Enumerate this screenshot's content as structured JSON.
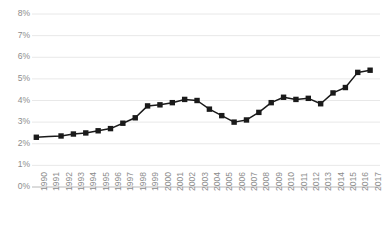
{
  "chart_data": {
    "type": "line",
    "title": "",
    "subtitle": "",
    "xlabel": "",
    "ylabel": "",
    "ylim": [
      0,
      8
    ],
    "ytick_values": [
      0,
      1,
      2,
      3,
      4,
      5,
      6,
      7,
      8
    ],
    "ytick_labels": [
      "0%",
      "1%",
      "2%",
      "3%",
      "4%",
      "5%",
      "6%",
      "7%",
      "8%"
    ],
    "y_unit": "%",
    "grid": true,
    "grid_axis": "y",
    "grid_color": "#e2e2e2",
    "legend": false,
    "legend_entries": [],
    "annotations": [],
    "line_color": "#1a1a1a",
    "marker": "square",
    "marker_color": "#1a1a1a",
    "background_color": "#ffffff",
    "axis_label_color": "#8c8c8c",
    "x_tick_rotation": -90,
    "categories": [
      "1990",
      "1991",
      "1992",
      "1993",
      "1994",
      "1995",
      "1996",
      "1997",
      "1998",
      "1999",
      "2000",
      "2001",
      "2002",
      "2003",
      "2004",
      "2005",
      "2006",
      "2007",
      "2008",
      "2009",
      "2010",
      "2011",
      "2012",
      "2013",
      "2014",
      "2015",
      "2016",
      "2017"
    ],
    "values": [
      2.3,
      2.33,
      2.36,
      2.45,
      2.5,
      2.6,
      2.7,
      2.95,
      3.2,
      3.75,
      3.8,
      3.9,
      4.05,
      4.0,
      3.6,
      3.3,
      3.0,
      3.1,
      3.45,
      3.9,
      4.15,
      4.05,
      4.1,
      3.85,
      4.35,
      4.6,
      5.3,
      5.4
    ],
    "markers_shown": [
      true,
      false,
      true,
      true,
      true,
      true,
      true,
      true,
      true,
      true,
      true,
      true,
      true,
      true,
      true,
      true,
      true,
      true,
      true,
      true,
      true,
      true,
      true,
      true,
      true,
      true,
      true,
      true
    ]
  }
}
